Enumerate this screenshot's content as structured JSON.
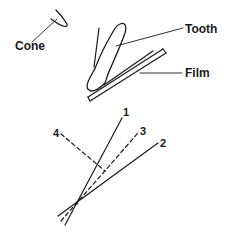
{
  "diagram": {
    "type": "dental-radiography-angle-illustration",
    "top_panel": {
      "labels": {
        "cone": "Cone",
        "tooth": "Tooth",
        "film": "Film"
      }
    },
    "bottom_panel": {
      "lines": [
        {
          "id": "1",
          "label": "1",
          "style": "solid"
        },
        {
          "id": "2",
          "label": "2",
          "style": "solid"
        },
        {
          "id": "3",
          "label": "3",
          "style": "dashed"
        },
        {
          "id": "4",
          "label": "4",
          "style": "dashed"
        }
      ]
    },
    "colors": {
      "ink": "#1a1a1a",
      "background": "#ffffff"
    }
  }
}
